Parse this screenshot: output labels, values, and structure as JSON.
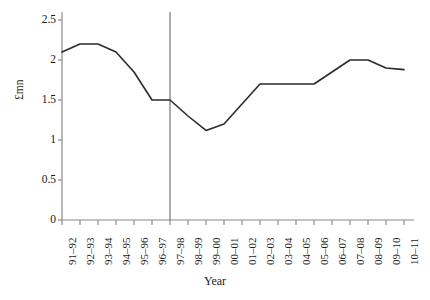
{
  "chart_data": {
    "type": "line",
    "title": "",
    "xlabel": "Year",
    "ylabel": "£mn",
    "categories": [
      "91–92",
      "92–93",
      "93–94",
      "94–95",
      "95–96",
      "96–97",
      "97–98",
      "98–99",
      "99–00",
      "00–01",
      "01–02",
      "02–03",
      "03–04",
      "04–05",
      "05–06",
      "06–07",
      "07–08",
      "08–09",
      "09–10",
      "10–11"
    ],
    "values": [
      2.1,
      2.2,
      2.2,
      2.1,
      1.85,
      1.5,
      1.5,
      1.3,
      1.12,
      1.2,
      1.45,
      1.7,
      1.7,
      1.7,
      1.7,
      1.85,
      2.0,
      2.0,
      1.9,
      1.88
    ],
    "ylim": [
      0,
      2.5
    ],
    "ytick_labels": [
      "0",
      "0.5",
      "1",
      "1.5",
      "2",
      "2.5"
    ],
    "ytick_values": [
      0,
      0.5,
      1,
      1.5,
      2,
      2.5
    ],
    "grid": false,
    "legend": "none",
    "series_color": "#2b2b2b",
    "axis_color": "#8a8a8a",
    "annotations": [
      {
        "name": "vertical-reference-line",
        "type": "vline",
        "category": "97–98",
        "x_value": 6,
        "color": "#6a6a6a"
      }
    ]
  }
}
